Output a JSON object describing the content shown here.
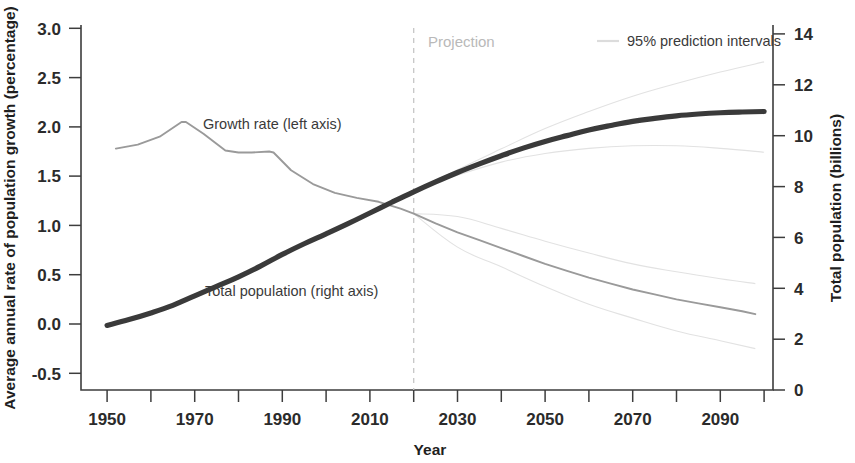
{
  "chart_data": {
    "type": "line",
    "title": "",
    "xlabel": "Year",
    "ylabel_left": "Average annual rate of population growth (percentage)",
    "ylabel_right": "Total population (billions)",
    "xlim": [
      1950,
      2100
    ],
    "ylim_left": [
      -0.5,
      3.0
    ],
    "ylim_right": [
      0,
      14
    ],
    "grid": false,
    "xticks_major": [
      1950,
      1970,
      1990,
      2010,
      2030,
      2050,
      2070,
      2090
    ],
    "xtick_labels": [
      "1950",
      "1970",
      "1990",
      "2010",
      "2030",
      "2050",
      "2070",
      "2090"
    ],
    "xticks_minor": [
      1960,
      1980,
      2000,
      2020,
      2040,
      2060,
      2080,
      2100
    ],
    "yticks_left": [
      -0.5,
      0.0,
      0.5,
      1.0,
      1.5,
      2.0,
      2.5,
      3.0
    ],
    "ytick_labels_left": [
      "-0.5",
      "0.0",
      "0.5",
      "1.0",
      "1.5",
      "2.0",
      "2.5",
      "3.0"
    ],
    "yticks_right": [
      0,
      2,
      4,
      6,
      8,
      10,
      12,
      14
    ],
    "ytick_labels_right": [
      "0",
      "2",
      "4",
      "6",
      "8",
      "10",
      "12",
      "14"
    ],
    "projection_year": 2020,
    "projection_label": "Projection",
    "legend": {
      "position": "top-right",
      "entries": [
        {
          "label": "95% prediction intervals",
          "color": "#dcdcdc",
          "style": "thin-line"
        }
      ]
    },
    "annotations": [
      {
        "text": "Growth rate (left axis)",
        "x": 1982,
        "y_left": 2.08
      },
      {
        "text": "Total population (right axis)",
        "x": 1985,
        "y_left": 0.44
      }
    ],
    "series": [
      {
        "name": "Growth rate (left axis)",
        "axis": "left",
        "unit": "percentage",
        "color": "#9a9a9a",
        "x": [
          1952,
          1957,
          1962,
          1967,
          1968,
          1972,
          1977,
          1980,
          1983,
          1987,
          1988,
          1992,
          1997,
          2002,
          2007,
          2012,
          2017,
          2020,
          2025,
          2030,
          2035,
          2040,
          2045,
          2050,
          2055,
          2060,
          2065,
          2070,
          2075,
          2080,
          2085,
          2090,
          2095,
          2098
        ],
        "values": [
          1.78,
          1.82,
          1.9,
          2.05,
          2.05,
          1.93,
          1.76,
          1.74,
          1.74,
          1.75,
          1.74,
          1.56,
          1.42,
          1.33,
          1.28,
          1.24,
          1.17,
          1.12,
          1.02,
          0.93,
          0.85,
          0.77,
          0.69,
          0.61,
          0.54,
          0.47,
          0.41,
          0.35,
          0.3,
          0.25,
          0.21,
          0.17,
          0.13,
          0.1
        ]
      },
      {
        "name": "Total population (right axis)",
        "axis": "right",
        "unit": "billions",
        "color": "#3a3a3a",
        "x": [
          1950,
          1955,
          1960,
          1965,
          1970,
          1975,
          1980,
          1985,
          1990,
          1995,
          2000,
          2005,
          2010,
          2015,
          2020,
          2025,
          2030,
          2035,
          2040,
          2045,
          2050,
          2055,
          2060,
          2065,
          2070,
          2075,
          2080,
          2085,
          2090,
          2095,
          2100
        ],
        "values": [
          2.54,
          2.77,
          3.03,
          3.33,
          3.7,
          4.07,
          4.45,
          4.87,
          5.33,
          5.75,
          6.14,
          6.54,
          6.96,
          7.38,
          7.79,
          8.18,
          8.55,
          8.89,
          9.21,
          9.51,
          9.77,
          10.0,
          10.22,
          10.4,
          10.56,
          10.68,
          10.78,
          10.85,
          10.9,
          10.93,
          10.95
        ]
      },
      {
        "name": "95% prediction interval upper (population)",
        "axis": "right",
        "unit": "billions",
        "color": "#e2e2e2",
        "x": [
          2020,
          2030,
          2040,
          2050,
          2060,
          2070,
          2080,
          2090,
          2100
        ],
        "values": [
          7.79,
          8.66,
          9.48,
          10.28,
          10.95,
          11.55,
          12.05,
          12.5,
          12.9
        ]
      },
      {
        "name": "95% prediction interval lower (population)",
        "axis": "right",
        "unit": "billions",
        "color": "#e2e2e2",
        "x": [
          2020,
          2030,
          2040,
          2050,
          2060,
          2070,
          2080,
          2090,
          2100
        ],
        "values": [
          7.79,
          8.44,
          8.96,
          9.3,
          9.5,
          9.6,
          9.6,
          9.5,
          9.35
        ]
      },
      {
        "name": "95% prediction interval upper (growth rate)",
        "axis": "left",
        "unit": "percentage",
        "color": "#e2e2e2",
        "x": [
          2020,
          2030,
          2040,
          2050,
          2060,
          2070,
          2080,
          2090,
          2098
        ],
        "values": [
          1.12,
          1.09,
          0.97,
          0.84,
          0.72,
          0.61,
          0.53,
          0.46,
          0.41
        ]
      },
      {
        "name": "95% prediction interval lower (growth rate)",
        "axis": "left",
        "unit": "percentage",
        "color": "#e2e2e2",
        "x": [
          2020,
          2030,
          2040,
          2050,
          2060,
          2070,
          2080,
          2090,
          2098
        ],
        "values": [
          1.12,
          0.78,
          0.58,
          0.38,
          0.2,
          0.06,
          -0.07,
          -0.17,
          -0.25
        ]
      }
    ]
  },
  "axes": {
    "x_title": "Year",
    "y_left_title": "Average annual rate of population growth (percentage)",
    "y_right_title": "Total population (billions)"
  },
  "annotations": {
    "growth_rate": "Growth rate (left axis)",
    "total_population": "Total population (right axis)",
    "projection": "Projection",
    "prediction_intervals": "95% prediction intervals"
  }
}
